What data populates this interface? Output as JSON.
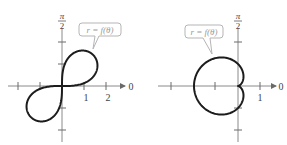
{
  "figures": [
    {
      "id": "left",
      "type": "polar-graph",
      "curve_name": "lemniscate",
      "callout_label": "r = f(θ)",
      "polar_axis_label": "0",
      "vertical_axis_label_num": "π",
      "vertical_axis_label_den": "2",
      "tick_labels": [
        "1",
        "2"
      ]
    },
    {
      "id": "right",
      "type": "polar-graph",
      "curve_name": "cardioid",
      "callout_label": "r = f(θ)",
      "polar_axis_label": "0",
      "vertical_axis_label_num": "π",
      "vertical_axis_label_den": "2",
      "tick_labels": [
        "1"
      ]
    }
  ],
  "colors": {
    "curve": "#1c1c1c",
    "axis": "#8a8a8a",
    "callout_border": "#b5b5b5",
    "callout_text": "#9a9a9a"
  }
}
